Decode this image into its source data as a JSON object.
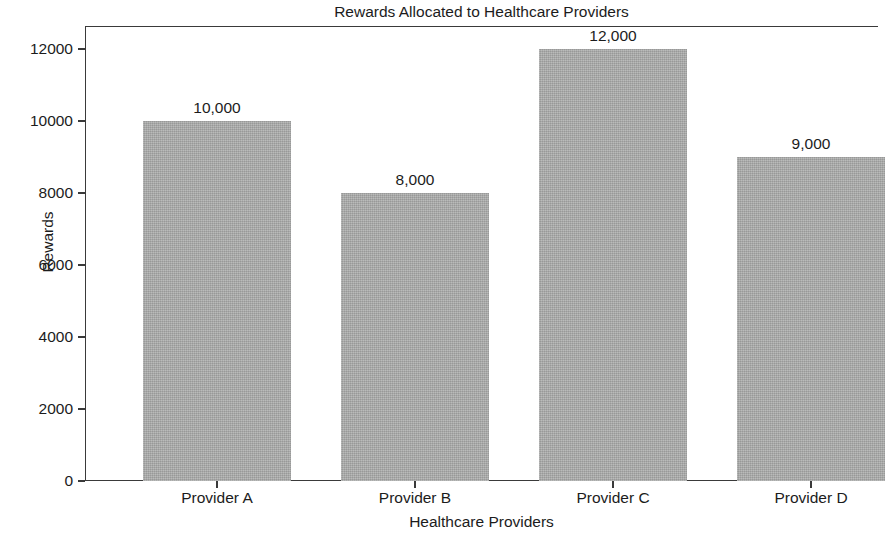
{
  "chart_data": {
    "type": "bar",
    "title": "Rewards Allocated to Healthcare Providers",
    "xlabel": "Healthcare Providers",
    "ylabel": "Rewards",
    "categories": [
      "Provider A",
      "Provider B",
      "Provider C",
      "Provider D"
    ],
    "values": [
      10000,
      8000,
      12000,
      9000
    ],
    "value_labels": [
      "10,000",
      "8,000",
      "12,000",
      "9,000"
    ],
    "ylim": [
      0,
      12700
    ],
    "ytick_labels": [
      "0",
      "2000",
      "4000",
      "6000",
      "8000",
      "10000",
      "12000"
    ],
    "ytick_values": [
      0,
      2000,
      4000,
      6000,
      8000,
      10000,
      12000
    ],
    "grid": false,
    "legend": false,
    "bar_color": "#aaabaa",
    "axis_color": "#3a3a3a",
    "text_color": "#1c1c1c",
    "background": "#ffffff"
  }
}
